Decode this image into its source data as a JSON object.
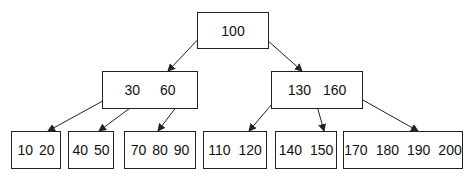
{
  "diagram": {
    "type": "b-tree",
    "root": {
      "keys": [
        "100"
      ]
    },
    "level1": [
      {
        "keys": [
          "30",
          "60"
        ]
      },
      {
        "keys": [
          "130",
          "160"
        ]
      }
    ],
    "leaves": [
      {
        "keys": [
          "10",
          "20"
        ]
      },
      {
        "keys": [
          "40",
          "50"
        ]
      },
      {
        "keys": [
          "70",
          "80",
          "90"
        ]
      },
      {
        "keys": [
          "110",
          "120"
        ]
      },
      {
        "keys": [
          "140",
          "150"
        ]
      },
      {
        "keys": [
          "170",
          "180",
          "190",
          "200"
        ]
      }
    ],
    "colors": {
      "line": "#222222",
      "background": "#ffffff"
    }
  }
}
